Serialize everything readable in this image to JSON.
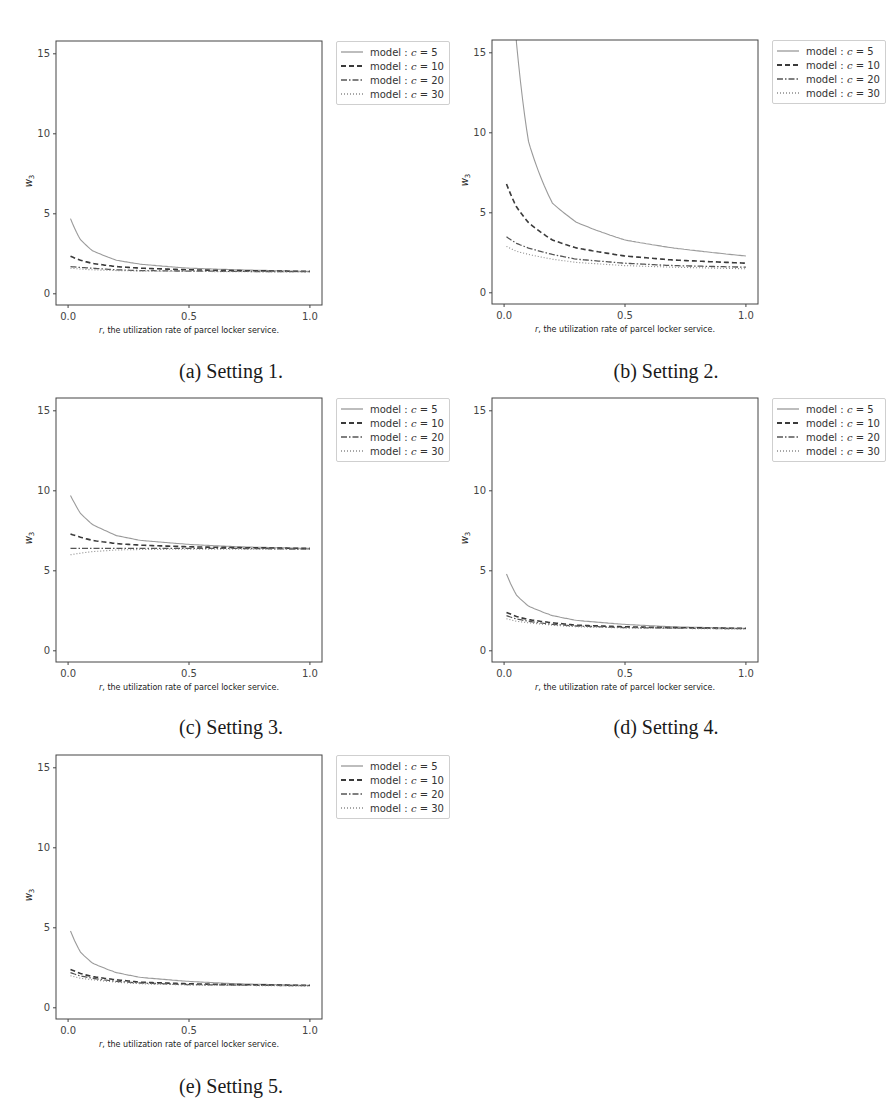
{
  "figure": {
    "legend_prefix": "model : ",
    "xlabel": "r, the utilization rate of parcel locker service.",
    "ylabel": "w3"
  },
  "panels": [
    {
      "id": "a",
      "caption": "(a) Setting 1."
    },
    {
      "id": "b",
      "caption": "(b) Setting 2."
    },
    {
      "id": "c",
      "caption": "(c) Setting 3."
    },
    {
      "id": "d",
      "caption": "(d) Setting 4."
    },
    {
      "id": "e",
      "caption": "(e) Setting 5."
    }
  ],
  "legend": [
    {
      "label": "model : c = 5",
      "style": "solid",
      "color": "#9a9a9a"
    },
    {
      "label": "model : c = 10",
      "style": "dashed",
      "color": "#3a3a3a"
    },
    {
      "label": "model : c = 20",
      "style": "dashdot",
      "color": "#555555"
    },
    {
      "label": "model : c = 30",
      "style": "dotted",
      "color": "#8a8a8a"
    }
  ],
  "chart_data": [
    {
      "type": "line",
      "title": "(a) Setting 1.",
      "xlabel": "r, the utilization rate of parcel locker service.",
      "ylabel": "w3",
      "xlim": [
        -0.05,
        1.05
      ],
      "ylim": [
        -0.7,
        15.8
      ],
      "xticks": [
        0.0,
        0.5,
        1.0
      ],
      "yticks": [
        0,
        5,
        10,
        15
      ],
      "grid": false,
      "legend_position": "outside upper right",
      "x": [
        0.01,
        0.05,
        0.1,
        0.2,
        0.3,
        0.5,
        0.7,
        1.0
      ],
      "series": [
        {
          "name": "model : c = 5",
          "values": [
            4.7,
            3.4,
            2.7,
            2.1,
            1.85,
            1.6,
            1.5,
            1.4
          ]
        },
        {
          "name": "model : c = 10",
          "values": [
            2.35,
            2.1,
            1.9,
            1.7,
            1.6,
            1.5,
            1.45,
            1.4
          ]
        },
        {
          "name": "model : c = 20",
          "values": [
            1.7,
            1.65,
            1.6,
            1.5,
            1.45,
            1.42,
            1.4,
            1.38
          ]
        },
        {
          "name": "model : c = 30",
          "values": [
            1.6,
            1.55,
            1.5,
            1.45,
            1.42,
            1.4,
            1.38,
            1.36
          ]
        }
      ]
    },
    {
      "type": "line",
      "title": "(b) Setting 2.",
      "xlabel": "r, the utilization rate of parcel locker service.",
      "ylabel": "w3",
      "xlim": [
        -0.05,
        1.05
      ],
      "ylim": [
        -0.7,
        15.8
      ],
      "xticks": [
        0.0,
        0.5,
        1.0
      ],
      "yticks": [
        0,
        5,
        10,
        15
      ],
      "grid": false,
      "legend_position": "outside upper right",
      "x": [
        0.01,
        0.05,
        0.1,
        0.2,
        0.3,
        0.5,
        0.7,
        1.0
      ],
      "series": [
        {
          "name": "model : c = 5",
          "values": [
            30.0,
            15.8,
            9.5,
            5.6,
            4.4,
            3.3,
            2.8,
            2.3
          ]
        },
        {
          "name": "model : c = 10",
          "values": [
            6.8,
            5.4,
            4.4,
            3.3,
            2.8,
            2.3,
            2.05,
            1.85
          ]
        },
        {
          "name": "model : c = 20",
          "values": [
            3.5,
            3.1,
            2.8,
            2.4,
            2.1,
            1.85,
            1.7,
            1.6
          ]
        },
        {
          "name": "model : c = 30",
          "values": [
            2.9,
            2.6,
            2.4,
            2.1,
            1.9,
            1.7,
            1.6,
            1.5
          ]
        }
      ]
    },
    {
      "type": "line",
      "title": "(c) Setting 3.",
      "xlabel": "r, the utilization rate of parcel locker service.",
      "ylabel": "w3",
      "xlim": [
        -0.05,
        1.05
      ],
      "ylim": [
        -0.7,
        15.8
      ],
      "xticks": [
        0.0,
        0.5,
        1.0
      ],
      "yticks": [
        0,
        5,
        10,
        15
      ],
      "grid": false,
      "legend_position": "outside upper right",
      "x": [
        0.01,
        0.05,
        0.1,
        0.2,
        0.3,
        0.5,
        0.7,
        1.0
      ],
      "series": [
        {
          "name": "model : c = 5",
          "values": [
            9.7,
            8.6,
            7.9,
            7.2,
            6.9,
            6.65,
            6.5,
            6.4
          ]
        },
        {
          "name": "model : c = 10",
          "values": [
            7.3,
            7.1,
            6.9,
            6.7,
            6.6,
            6.5,
            6.45,
            6.4
          ]
        },
        {
          "name": "model : c = 20",
          "values": [
            6.4,
            6.4,
            6.4,
            6.4,
            6.4,
            6.4,
            6.4,
            6.35
          ]
        },
        {
          "name": "model : c = 30",
          "values": [
            6.0,
            6.1,
            6.2,
            6.3,
            6.33,
            6.35,
            6.35,
            6.35
          ]
        }
      ]
    },
    {
      "type": "line",
      "title": "(d) Setting 4.",
      "xlabel": "r, the utilization rate of parcel locker service.",
      "ylabel": "w3",
      "xlim": [
        -0.05,
        1.05
      ],
      "ylim": [
        -0.7,
        15.8
      ],
      "xticks": [
        0.0,
        0.5,
        1.0
      ],
      "yticks": [
        0,
        5,
        10,
        15
      ],
      "grid": false,
      "legend_position": "outside upper right",
      "x": [
        0.01,
        0.05,
        0.1,
        0.2,
        0.3,
        0.5,
        0.7,
        1.0
      ],
      "series": [
        {
          "name": "model : c = 5",
          "values": [
            4.8,
            3.5,
            2.8,
            2.2,
            1.9,
            1.65,
            1.5,
            1.4
          ]
        },
        {
          "name": "model : c = 10",
          "values": [
            2.4,
            2.15,
            1.95,
            1.75,
            1.6,
            1.5,
            1.45,
            1.4
          ]
        },
        {
          "name": "model : c = 20",
          "values": [
            2.2,
            2.0,
            1.85,
            1.65,
            1.55,
            1.45,
            1.42,
            1.38
          ]
        },
        {
          "name": "model : c = 30",
          "values": [
            2.0,
            1.85,
            1.75,
            1.6,
            1.5,
            1.43,
            1.4,
            1.36
          ]
        }
      ]
    },
    {
      "type": "line",
      "title": "(e) Setting 5.",
      "xlabel": "r, the utilization rate of parcel locker service.",
      "ylabel": "w3",
      "xlim": [
        -0.05,
        1.05
      ],
      "ylim": [
        -0.7,
        15.8
      ],
      "xticks": [
        0.0,
        0.5,
        1.0
      ],
      "yticks": [
        0,
        5,
        10,
        15
      ],
      "grid": false,
      "legend_position": "outside upper right",
      "x": [
        0.01,
        0.05,
        0.1,
        0.2,
        0.3,
        0.5,
        0.7,
        1.0
      ],
      "series": [
        {
          "name": "model : c = 5",
          "values": [
            4.8,
            3.5,
            2.8,
            2.2,
            1.9,
            1.65,
            1.5,
            1.4
          ]
        },
        {
          "name": "model : c = 10",
          "values": [
            2.4,
            2.15,
            1.95,
            1.75,
            1.6,
            1.5,
            1.45,
            1.4
          ]
        },
        {
          "name": "model : c = 20",
          "values": [
            2.2,
            2.0,
            1.85,
            1.65,
            1.55,
            1.45,
            1.42,
            1.38
          ]
        },
        {
          "name": "model : c = 30",
          "values": [
            2.0,
            1.85,
            1.75,
            1.6,
            1.5,
            1.43,
            1.4,
            1.36
          ]
        }
      ]
    }
  ]
}
